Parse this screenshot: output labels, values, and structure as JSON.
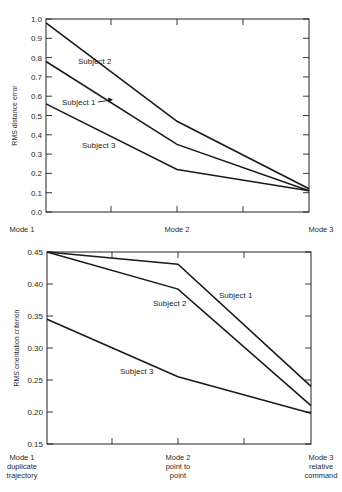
{
  "chart_data": [
    {
      "type": "line",
      "title": "",
      "xlabel": "",
      "ylabel": "RMS distance error",
      "categories": [
        "Mode 1",
        "Mode 2",
        "Mode 3"
      ],
      "ylim": [
        0.0,
        1.0
      ],
      "yticks": [
        "0.0",
        "0.1",
        "0.2",
        "0.3",
        "0.4",
        "0.5",
        "0.6",
        "0.7",
        "0.8",
        "0.9",
        "1.0"
      ],
      "grid": false,
      "legend": "inline labels",
      "series": [
        {
          "name": "Subject 1",
          "values": [
            0.78,
            0.35,
            0.11
          ]
        },
        {
          "name": "Subject 2",
          "values": [
            0.98,
            0.47,
            0.12
          ]
        },
        {
          "name": "Subject 3",
          "values": [
            0.56,
            0.22,
            0.11
          ]
        }
      ],
      "annotations": [
        {
          "text": "Subject 2",
          "x": 78,
          "y": 64
        },
        {
          "text": "Subject 1",
          "x": 62,
          "y": 105,
          "arrow": true
        },
        {
          "text": "Subject 3",
          "x": 82,
          "y": 148
        }
      ]
    },
    {
      "type": "line",
      "title": "",
      "xlabel": "",
      "ylabel": "RMS orientation criterion",
      "categories": [
        "Mode 1",
        "Mode 2",
        "Mode 3"
      ],
      "category_sublabels": [
        [
          "duplicate",
          "trajectory"
        ],
        [
          "point to",
          "point"
        ],
        [
          "relative",
          "command"
        ]
      ],
      "ylim": [
        0.15,
        0.45
      ],
      "yticks": [
        "0.15",
        "0.20",
        "0.25",
        "0.30",
        "0.35",
        "0.40",
        "0.45"
      ],
      "grid": false,
      "legend": "inline labels",
      "series": [
        {
          "name": "Subject 1",
          "values": [
            0.45,
            0.431,
            0.24
          ]
        },
        {
          "name": "Subject 2",
          "values": [
            0.45,
            0.392,
            0.21
          ]
        },
        {
          "name": "Subject 3",
          "values": [
            0.345,
            0.255,
            0.198
          ]
        }
      ],
      "annotations": [
        {
          "text": "Subject 1",
          "x": 219,
          "y": 298
        },
        {
          "text": "Subject 2",
          "x": 153,
          "y": 306
        },
        {
          "text": "Subject 3",
          "x": 120,
          "y": 374
        }
      ]
    }
  ]
}
